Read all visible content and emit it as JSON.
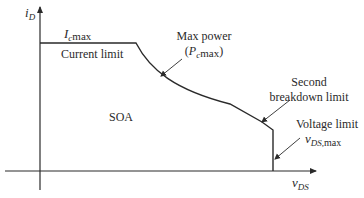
{
  "diagram": {
    "axes": {
      "y": {
        "symbol": "i",
        "subscript": "D"
      },
      "x": {
        "symbol": "v",
        "subscript": "DS"
      }
    },
    "labels": {
      "current_max": {
        "symbol": "I",
        "subscript": "c",
        "suffix": "max"
      },
      "current_limit": "Current limit",
      "max_power_line1": "Max power",
      "max_power_open": "(",
      "max_power_symbol": "P",
      "max_power_sub": "c",
      "max_power_suffix": "max",
      "max_power_close": ")",
      "second_breakdown_line1": "Second",
      "second_breakdown_line2": "breakdown limit",
      "soa": "SOA",
      "voltage_limit": "Voltage limit",
      "vds_max_symbol": "v",
      "vds_max_sub": "DS,",
      "vds_max_suffix": "max"
    },
    "colors": {
      "line": "#2a2a2a",
      "background": "#ffffff"
    }
  }
}
